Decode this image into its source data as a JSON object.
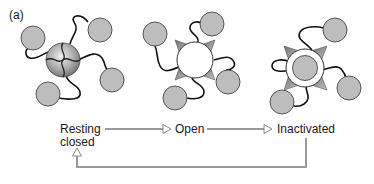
{
  "panel_label": "(a)",
  "states": [
    {
      "id": "resting",
      "label_line1": "Resting",
      "label_line2": "closed"
    },
    {
      "id": "open",
      "label": "Open"
    },
    {
      "id": "inactivated",
      "label": "Inactivated"
    }
  ],
  "colors": {
    "ball_fill": "#bdbdbd",
    "ball_stroke": "#555555",
    "arrow": "#9a9a9a",
    "line": "#111111",
    "wedge": "#8e8e8e"
  }
}
